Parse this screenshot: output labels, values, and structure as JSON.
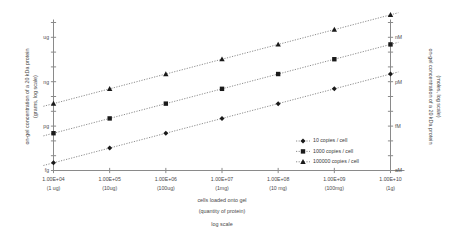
{
  "chart_data": {
    "type": "scatter",
    "title": "",
    "subtitle": "",
    "xlabel": "cells loaded onto gel (quantity of protein) log scale",
    "ylabel": "on-gel concentration of a 20 kDa protein (grams, log scale)",
    "ylabel_right": "on-gel concentration of a 20 kDa protein (moles, log scale)",
    "grid": false,
    "legend_position": "inside-right",
    "x_log": true,
    "y_log": true,
    "xlim": [
      10000,
      10000000000
    ],
    "x_tick_values": [
      10000,
      100000,
      1000000,
      10000000,
      100000000,
      1000000000,
      10000000000
    ],
    "x_tick_labels": [
      "1.00E+04",
      "1.00E+05",
      "1.00E+06",
      "1.00E+07",
      "1.00E+08",
      "1.00E+09",
      "1.00E+10"
    ],
    "x_tick_sublabels": [
      "(1 ug)",
      "(10ug)",
      "(100ug)",
      "(1mg)",
      "(10 mg)",
      "(100mg)",
      "(1g)"
    ],
    "y_tick_labels_left": [
      "ug",
      "ng",
      "pg",
      "fg"
    ],
    "y_tick_labels_right": [
      "nM",
      "pM",
      "fM",
      "aM"
    ],
    "ylim_grams": [
      1e-15,
      1e-05
    ],
    "series": [
      {
        "name": "10 copies / cell",
        "marker": "diamond",
        "x": [
          10000,
          100000,
          1000000,
          10000000,
          100000000,
          1000000000,
          10000000000
        ],
        "values": [
          3.3e-15,
          3.3e-14,
          3.3e-13,
          3.3e-12,
          3.3e-11,
          3.3e-10,
          3.3e-09
        ]
      },
      {
        "name": "1000 copies / cell",
        "marker": "square",
        "x": [
          10000,
          100000,
          1000000,
          10000000,
          100000000,
          1000000000,
          10000000000
        ],
        "values": [
          3.3e-13,
          3.3e-12,
          3.3e-11,
          3.3e-10,
          3.3e-09,
          3.3e-08,
          3.3e-07
        ]
      },
      {
        "name": "100000 copies / cell",
        "marker": "triangle",
        "x": [
          10000,
          100000,
          1000000,
          10000000,
          100000000,
          1000000000,
          10000000000
        ],
        "values": [
          3.3e-11,
          3.3e-10,
          3.3e-09,
          3.3e-08,
          3.3e-07,
          3.3e-06,
          3.3e-05
        ]
      }
    ]
  },
  "axes": {
    "left_title_line1": "on-gel concentration of a 20 kDa protein",
    "left_title_line2": "(grams, log scale)",
    "right_title_line1": "on-gel concentration of a 20 kDa protein",
    "right_title_line2": "(moles, log scale)",
    "x_title_line1": "cells loaded onto gel",
    "x_title_line2": "(quantity of protein)",
    "x_title_line3": "log scale"
  },
  "legend": {
    "items": [
      {
        "label": "10 copies / cell",
        "marker": "diamond"
      },
      {
        "label": "1000 copies / cell",
        "marker": "square"
      },
      {
        "label": "100000 copies / cell",
        "marker": "triangle"
      }
    ]
  },
  "colors": {
    "axis": "#8a8a8a",
    "marker": "#1a1a1a",
    "line": "#707070",
    "text": "#3a3a3a",
    "background": "#ffffff"
  }
}
